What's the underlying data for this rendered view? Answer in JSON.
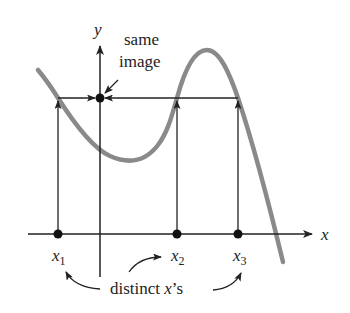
{
  "diagram": {
    "axes": {
      "x_label": "x",
      "y_label": "y"
    },
    "points": [
      {
        "id": "x1",
        "label": "x",
        "subscript": "1"
      },
      {
        "id": "x2",
        "label": "x",
        "subscript": "2"
      },
      {
        "id": "x3",
        "label": "x",
        "subscript": "3"
      }
    ],
    "annotations": {
      "same_image_line1": "same",
      "same_image_line2": "image",
      "distinct_prefix": "distinct ",
      "distinct_var": "x",
      "distinct_suffix": "’s"
    },
    "colors": {
      "curve": "#8a8a8a",
      "axes": "#222222",
      "background": "#ffffff"
    }
  }
}
